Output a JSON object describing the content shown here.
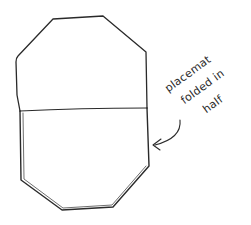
{
  "diagram": {
    "subject": "placemat",
    "annotation": {
      "lines": [
        "placemat",
        "folded in",
        "half"
      ],
      "full_text": "placemat folded in half"
    },
    "colors": {
      "stroke": "#2a2a2a",
      "background": "#ffffff"
    },
    "shape": {
      "type": "octagon",
      "state": "folded in half",
      "fold_line": "horizontal"
    }
  }
}
